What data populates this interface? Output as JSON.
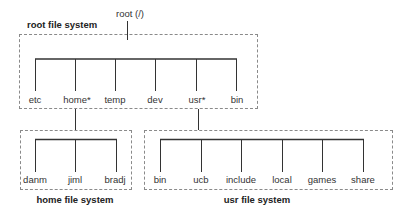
{
  "root": {
    "label": "root (/)"
  },
  "root_fs": {
    "title": "root file system",
    "dirs": [
      "etc",
      "home*",
      "temp",
      "dev",
      "usr*",
      "bin"
    ]
  },
  "home_fs": {
    "title": "home file system",
    "dirs": [
      "danm",
      "jiml",
      "bradj"
    ]
  },
  "usr_fs": {
    "title": "usr file system",
    "dirs": [
      "bin",
      "ucb",
      "include",
      "local",
      "games",
      "share"
    ]
  },
  "colors": {
    "line": "#333333",
    "dashed_border": "#8a8a8a",
    "text": "#333333"
  }
}
